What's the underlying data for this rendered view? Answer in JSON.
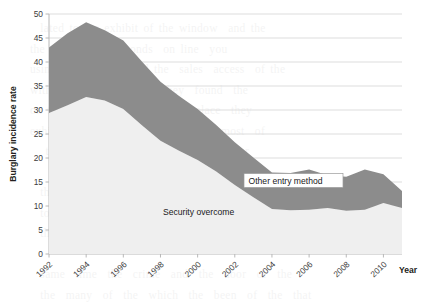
{
  "chart_data": {
    "type": "area",
    "title": "",
    "subtitle": "",
    "xlabel": "Year",
    "ylabel": "Burglary incidence rate",
    "stacked": true,
    "grid": true,
    "legend_position": "inline-annotations",
    "xlim": [
      1992,
      2011
    ],
    "ylim": [
      0,
      50
    ],
    "ytick_step": 5,
    "yticks": [
      "0",
      "5",
      "10",
      "15",
      "20",
      "25",
      "30",
      "35",
      "40",
      "45",
      "50"
    ],
    "xticks": [
      "1992",
      "1994",
      "1996",
      "1998",
      "2000",
      "2002",
      "2004",
      "2006",
      "2008",
      "2010"
    ],
    "x": [
      1992,
      1993,
      1994,
      1995,
      1996,
      1997,
      1998,
      1999,
      2000,
      2001,
      2002,
      2003,
      2004,
      2005,
      2006,
      2007,
      2008,
      2009,
      2010,
      2011
    ],
    "series": [
      {
        "name": "Security overcome",
        "color": "#efefef",
        "values": [
          29.4,
          31.0,
          32.7,
          32.0,
          30.2,
          26.8,
          23.6,
          21.5,
          19.6,
          17.2,
          14.4,
          11.8,
          9.4,
          9.1,
          9.2,
          9.6,
          9.0,
          9.2,
          10.6,
          9.6
        ]
      },
      {
        "name": "Other entry method",
        "color": "#8c8c8c",
        "values": [
          13.6,
          15.0,
          15.6,
          14.6,
          14.3,
          13.3,
          12.3,
          11.4,
          10.6,
          9.7,
          8.9,
          8.3,
          7.6,
          7.8,
          8.4,
          6.8,
          7.1,
          8.4,
          6.0,
          3.5
        ]
      }
    ],
    "totals": [
      43.0,
      46.0,
      48.3,
      46.6,
      44.5,
      40.1,
      35.9,
      32.9,
      30.2,
      26.9,
      23.3,
      20.1,
      17.0,
      16.9,
      17.6,
      16.4,
      16.1,
      17.6,
      16.6,
      13.1
    ],
    "annotations": [
      {
        "text": "Other entry method",
        "boxed": true
      },
      {
        "text": "Security overcome",
        "boxed": false
      }
    ]
  },
  "bleed_text": "  lated to the exhibit of the window  and the\nthe sort of  the seconds  on line  you\nusing the  exhibit  and the  sales  access  of the\nwith the  various  where they  found  the\non the  first  and the  second  place  they\nexhibit  the  sales  and  were  the  most  of\n   them  also  the  entry  and  the  other\n\n  the  door  which  just  so  for  the  or\n  to  be  the  other  of  the  window  and\n  the  security  and  the  burglary  of  the  door\n\n  same  time  the  crime  and  the  door  of  the\n  the  many  of  the  which  the  been  of  the  that"
}
